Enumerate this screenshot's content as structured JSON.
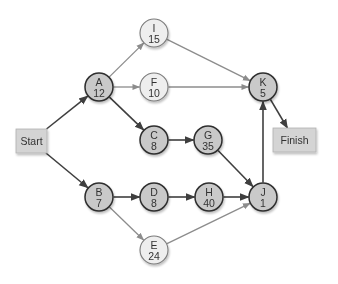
{
  "diagram": {
    "type": "network-diagram",
    "colors": {
      "critical_fill": "#c9c9c9",
      "critical_stroke": "#2e2e2e",
      "critical_edge": "#3f3f3f",
      "noncritical_fill": "#eeeeee",
      "noncritical_stroke": "#7a7a7a",
      "noncritical_edge": "#8c8c8c",
      "box_fill": "#d4d4d4",
      "box_stroke": "#b0b0b0"
    },
    "terminals": {
      "start": {
        "label": "Start",
        "x": 16,
        "y": 129,
        "w": 31,
        "h": 24
      },
      "finish": {
        "label": "Finish",
        "x": 273,
        "y": 128,
        "w": 43,
        "h": 24
      }
    },
    "nodes": [
      {
        "id": "A",
        "name": "A",
        "duration": "12",
        "x": 99,
        "y": 87,
        "critical": true
      },
      {
        "id": "B",
        "name": "B",
        "duration": "7",
        "x": 99,
        "y": 197,
        "critical": true
      },
      {
        "id": "C",
        "name": "C",
        "duration": "8",
        "x": 154,
        "y": 140,
        "critical": true
      },
      {
        "id": "D",
        "name": "D",
        "duration": "8",
        "x": 154,
        "y": 197,
        "critical": true
      },
      {
        "id": "E",
        "name": "E",
        "duration": "24",
        "x": 154,
        "y": 250,
        "critical": false
      },
      {
        "id": "F",
        "name": "F",
        "duration": "10",
        "x": 154,
        "y": 87,
        "critical": false
      },
      {
        "id": "G",
        "name": "G",
        "duration": "35",
        "x": 208,
        "y": 140,
        "critical": true
      },
      {
        "id": "H",
        "name": "H",
        "duration": "40",
        "x": 209,
        "y": 197,
        "critical": true
      },
      {
        "id": "I",
        "name": "I",
        "duration": "15",
        "x": 154,
        "y": 33,
        "critical": false
      },
      {
        "id": "J",
        "name": "J",
        "duration": "1",
        "x": 263,
        "y": 197,
        "critical": true
      },
      {
        "id": "K",
        "name": "K",
        "duration": "5",
        "x": 263,
        "y": 87,
        "critical": true
      }
    ],
    "edges": [
      {
        "from": "Start",
        "to": "A",
        "critical": true
      },
      {
        "from": "Start",
        "to": "B",
        "critical": true
      },
      {
        "from": "A",
        "to": "I",
        "critical": false
      },
      {
        "from": "A",
        "to": "F",
        "critical": false
      },
      {
        "from": "A",
        "to": "C",
        "critical": true
      },
      {
        "from": "C",
        "to": "G",
        "critical": true
      },
      {
        "from": "G",
        "to": "J",
        "critical": true
      },
      {
        "from": "B",
        "to": "D",
        "critical": true
      },
      {
        "from": "B",
        "to": "E",
        "critical": false
      },
      {
        "from": "D",
        "to": "H",
        "critical": true
      },
      {
        "from": "H",
        "to": "J",
        "critical": true
      },
      {
        "from": "E",
        "to": "J",
        "critical": false
      },
      {
        "from": "I",
        "to": "K",
        "critical": false
      },
      {
        "from": "F",
        "to": "K",
        "critical": false
      },
      {
        "from": "J",
        "to": "K",
        "critical": true
      },
      {
        "from": "K",
        "to": "Finish",
        "critical": true
      }
    ]
  }
}
